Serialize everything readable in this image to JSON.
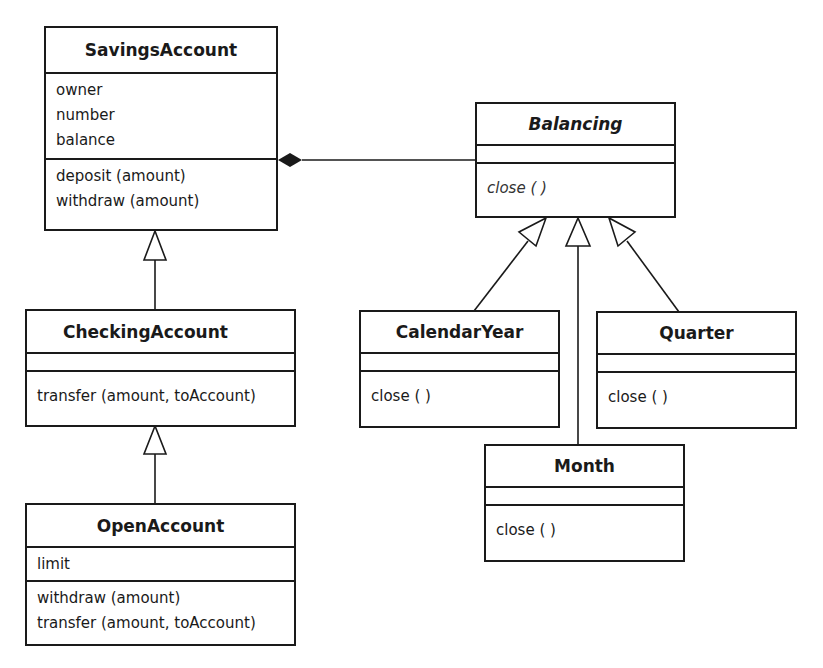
{
  "diagram": {
    "type": "UML class diagram",
    "classes": {
      "savings_account": {
        "name": "SavingsAccount",
        "attributes": [
          "owner",
          "number",
          "balance"
        ],
        "operations": [
          "deposit (amount)",
          "withdraw (amount)"
        ]
      },
      "checking_account": {
        "name": "CheckingAccount",
        "attributes": [],
        "operations": [
          "transfer (amount, toAccount)"
        ]
      },
      "open_account": {
        "name": "OpenAccount",
        "attributes": [
          "limit"
        ],
        "operations": [
          "withdraw (amount)",
          "transfer (amount, toAccount)"
        ]
      },
      "balancing": {
        "name": "Balancing",
        "abstract": true,
        "attributes": [],
        "operations": [
          "close ( )"
        ]
      },
      "calendar_year": {
        "name": "CalendarYear",
        "attributes": [],
        "operations": [
          "close ( )"
        ]
      },
      "quarter": {
        "name": "Quarter",
        "attributes": [],
        "operations": [
          "close ( )"
        ]
      },
      "month": {
        "name": "Month",
        "attributes": [],
        "operations": [
          "close ( )"
        ]
      }
    },
    "relationships": [
      {
        "type": "composition",
        "whole": "SavingsAccount",
        "part": "Balancing"
      },
      {
        "type": "generalization",
        "child": "CheckingAccount",
        "parent": "SavingsAccount"
      },
      {
        "type": "generalization",
        "child": "OpenAccount",
        "parent": "CheckingAccount"
      },
      {
        "type": "generalization",
        "child": "CalendarYear",
        "parent": "Balancing"
      },
      {
        "type": "generalization",
        "child": "Month",
        "parent": "Balancing"
      },
      {
        "type": "generalization",
        "child": "Quarter",
        "parent": "Balancing"
      }
    ],
    "colors": {
      "line": "#1a1a1a",
      "background": "#ffffff"
    }
  }
}
